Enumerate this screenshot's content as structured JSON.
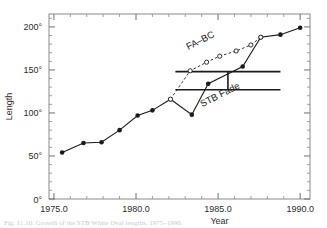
{
  "chart_data": {
    "type": "line",
    "title": "",
    "xlabel": "Year",
    "ylabel": "Length",
    "xlim": [
      1974.7,
      1990.6
    ],
    "ylim": [
      0,
      215
    ],
    "xticks": [
      1975.0,
      1980.0,
      1985.0,
      1990.0
    ],
    "xtick_labels": [
      "1975.0",
      "1980.0",
      "1985.0",
      "1990.0"
    ],
    "yticks": [
      0,
      50,
      100,
      150,
      200
    ],
    "ytick_labels": [
      "0°",
      "50°",
      "100°",
      "150°",
      "200°"
    ],
    "xminor_step": 1.0,
    "yminor_step": 10,
    "grid": false,
    "legend_position": "inline-annotations",
    "series": [
      {
        "name": "STB Fade",
        "style": "solid",
        "marker": "filled-circle",
        "color": "#1a1a1a",
        "x": [
          1975.5,
          1976.8,
          1977.9,
          1979.0,
          1980.1,
          1981.0,
          1982.1,
          1983.4,
          1984.4,
          1986.5,
          1987.6,
          1988.8,
          1990.0
        ],
        "y": [
          54,
          65,
          66,
          80,
          97,
          103,
          116,
          98,
          134,
          154,
          188,
          191,
          199
        ]
      },
      {
        "name": "FA–BC",
        "style": "dashed",
        "marker": "open-circle",
        "color": "#1a1a1a",
        "x": [
          1982.1,
          1983.3,
          1984.3,
          1985.1,
          1986.1,
          1987.0,
          1987.6
        ],
        "y": [
          116,
          149,
          159,
          166,
          172,
          179,
          188
        ]
      }
    ],
    "annotations": [
      {
        "name": "fa-bc-label",
        "text": "FA–BC",
        "x": 1984.0,
        "y": 181,
        "rotation": -27
      },
      {
        "name": "stb-fade-label",
        "text": "STB Fade",
        "x": 1985.2,
        "y": 118,
        "rotation": -27
      }
    ],
    "error_bars": [
      {
        "name": "stb-fade-error-bar",
        "x": 1985.6,
        "y_low": 127,
        "y_high": 148,
        "cap_half_width": 3.2
      }
    ]
  },
  "caption": {
    "text": "Fig. 11.10. Growth of the STB White Oval lengths, 1975–1990."
  }
}
